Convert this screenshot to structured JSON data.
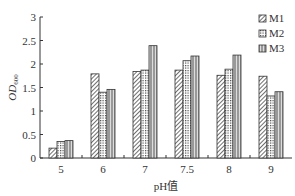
{
  "chart_data": {
    "type": "bar",
    "title": "",
    "xlabel": "pH值",
    "ylabel": "OD600",
    "ylim": [
      0,
      3
    ],
    "yticks": [
      "0",
      "0.5",
      "1",
      "1.5",
      "2",
      "2.5",
      "3"
    ],
    "categories": [
      "5",
      "6",
      "7",
      "7.5",
      "8",
      "9"
    ],
    "series": [
      {
        "name": "M1",
        "values": [
          0.21,
          1.79,
          1.84,
          1.87,
          1.76,
          1.74
        ]
      },
      {
        "name": "M2",
        "values": [
          0.35,
          1.4,
          1.87,
          2.07,
          1.89,
          1.32
        ]
      },
      {
        "name": "M3",
        "values": [
          0.37,
          1.46,
          2.39,
          2.17,
          2.19,
          1.41
        ]
      }
    ],
    "grid": false,
    "legend_position": "top-right"
  },
  "legend": {
    "m1": "M1",
    "m2": "M2",
    "m3": "M3"
  },
  "axis": {
    "xlabel": "pH值",
    "ylabel_main": "OD",
    "ylabel_sub": "600"
  }
}
